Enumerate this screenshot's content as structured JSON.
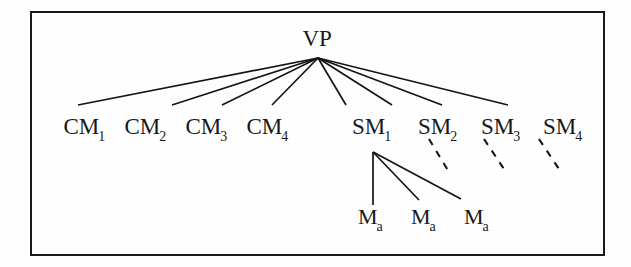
{
  "figure": {
    "type": "organizational-hierarchy-tree",
    "border_color": "#1a1a1a",
    "line_color": "#141414",
    "text_color": "#18181a",
    "background_color": "#fefefe"
  },
  "nodes": {
    "root": {
      "name": "vp",
      "base": "VP",
      "sub": "",
      "x": 317,
      "y": 38
    },
    "level2": [
      {
        "name": "cm-1",
        "base": "CM",
        "sub": "1",
        "x": 85,
        "y": 128
      },
      {
        "name": "cm-2",
        "base": "CM",
        "sub": "2",
        "x": 146,
        "y": 128
      },
      {
        "name": "cm-3",
        "base": "CM",
        "sub": "3",
        "x": 207,
        "y": 128
      },
      {
        "name": "cm-4",
        "base": "CM",
        "sub": "4",
        "x": 268,
        "y": 128
      },
      {
        "name": "sm-1",
        "base": "SM",
        "sub": "1",
        "x": 372,
        "y": 128
      },
      {
        "name": "sm-2",
        "base": "SM",
        "sub": "2",
        "x": 438,
        "y": 128
      },
      {
        "name": "sm-3",
        "base": "SM",
        "sub": "3",
        "x": 501,
        "y": 128
      },
      {
        "name": "sm-4",
        "base": "SM",
        "sub": "4",
        "x": 563,
        "y": 128
      }
    ],
    "level3": [
      {
        "name": "m-a-1",
        "base": "M",
        "sub": "a",
        "x": 371,
        "y": 218
      },
      {
        "name": "m-a-2",
        "base": "M",
        "sub": "a",
        "x": 424,
        "y": 218
      },
      {
        "name": "m-a-3",
        "base": "M",
        "sub": "a",
        "x": 477,
        "y": 218
      }
    ]
  },
  "edges": {
    "from_vp": {
      "apex_x": 318,
      "apex_y": 58,
      "targets": [
        {
          "name": "edge-vp-cm-1",
          "x": 78,
          "y": 105
        },
        {
          "name": "edge-vp-cm-2",
          "x": 172,
          "y": 105
        },
        {
          "name": "edge-vp-cm-3",
          "x": 222,
          "y": 105
        },
        {
          "name": "edge-vp-cm-4",
          "x": 272,
          "y": 105
        },
        {
          "name": "edge-vp-sm-1",
          "x": 346,
          "y": 105
        },
        {
          "name": "edge-vp-sm-2",
          "x": 392,
          "y": 105
        },
        {
          "name": "edge-vp-sm-3",
          "x": 442,
          "y": 105
        },
        {
          "name": "edge-vp-sm-4",
          "x": 508,
          "y": 105
        }
      ]
    },
    "from_sm1": {
      "apex_x": 373,
      "apex_y": 152,
      "targets": [
        {
          "name": "edge-sm1-ma-1",
          "x": 373,
          "y": 205
        },
        {
          "name": "edge-sm1-ma-2",
          "x": 419,
          "y": 200
        },
        {
          "name": "edge-sm1-ma-3",
          "x": 461,
          "y": 199
        }
      ]
    },
    "dashed": [
      {
        "name": "dashed-edge-sm-2",
        "x1": 429,
        "y1": 139,
        "x2": 449,
        "y2": 172
      },
      {
        "name": "dashed-edge-sm-3",
        "x1": 484,
        "y1": 139,
        "x2": 506,
        "y2": 172
      },
      {
        "name": "dashed-edge-sm-4",
        "x1": 539,
        "y1": 139,
        "x2": 561,
        "y2": 172
      }
    ]
  },
  "frame": {
    "name": "figure-border",
    "x": 31,
    "y": 12,
    "width": 573,
    "height": 243
  }
}
